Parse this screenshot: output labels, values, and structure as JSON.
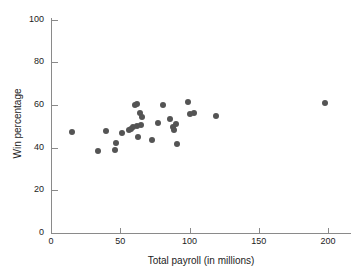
{
  "chart_data": {
    "type": "scatter",
    "title": "",
    "xlabel": "Total payroll (in millions)",
    "ylabel": "Win percentage",
    "xlim": [
      0,
      215
    ],
    "ylim": [
      0,
      104
    ],
    "xticks": [
      0,
      50,
      100,
      150,
      200
    ],
    "yticks": [
      0,
      20,
      40,
      60,
      80,
      100
    ],
    "xtick_labels": [
      "0",
      "50",
      "100",
      "150",
      "200"
    ],
    "ytick_labels": [
      "0",
      "20",
      "40",
      "60",
      "80",
      "100"
    ],
    "grid": false,
    "legend": "none",
    "marker_color": "#545454",
    "axis_color": "#8a8a8a",
    "points": [
      {
        "x": 15,
        "y": 47.5
      },
      {
        "x": 34,
        "y": 38.3
      },
      {
        "x": 40,
        "y": 47.8
      },
      {
        "x": 46,
        "y": 38.8
      },
      {
        "x": 47,
        "y": 42.3
      },
      {
        "x": 51,
        "y": 46.8
      },
      {
        "x": 56,
        "y": 48.3
      },
      {
        "x": 58,
        "y": 48.8
      },
      {
        "x": 59,
        "y": 49.8
      },
      {
        "x": 61,
        "y": 59.8
      },
      {
        "x": 62,
        "y": 60.5
      },
      {
        "x": 62,
        "y": 50.3
      },
      {
        "x": 63,
        "y": 44.8
      },
      {
        "x": 64,
        "y": 56.3
      },
      {
        "x": 65,
        "y": 50.8
      },
      {
        "x": 66,
        "y": 54.5
      },
      {
        "x": 73,
        "y": 43.5
      },
      {
        "x": 77,
        "y": 51.8
      },
      {
        "x": 81,
        "y": 59.8
      },
      {
        "x": 86,
        "y": 53.3
      },
      {
        "x": 88,
        "y": 49.8
      },
      {
        "x": 89,
        "y": 48.3
      },
      {
        "x": 90,
        "y": 51.3
      },
      {
        "x": 91,
        "y": 41.5
      },
      {
        "x": 99,
        "y": 61.3
      },
      {
        "x": 100,
        "y": 55.8
      },
      {
        "x": 103,
        "y": 56.3
      },
      {
        "x": 119,
        "y": 55.0
      },
      {
        "x": 198,
        "y": 61.0
      }
    ]
  }
}
